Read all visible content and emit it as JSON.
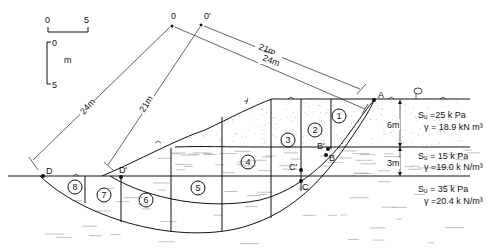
{
  "scale": {
    "horizontal": {
      "start": "0",
      "end": "5"
    },
    "vertical": {
      "start": "0",
      "end": "5",
      "unit": "m"
    }
  },
  "centers": [
    {
      "id": "center-o",
      "label": "0"
    },
    {
      "id": "center-o-prime",
      "label": "0'"
    }
  ],
  "radii": {
    "o_top": "24m",
    "o_prime_top": "21m",
    "o_left": "24m",
    "o_prime_left": "21m"
  },
  "points": {
    "A": "A",
    "B": "B",
    "B_prime": "B'",
    "C": "C",
    "C_prime": "C'",
    "D": "D",
    "D_prime": "D'"
  },
  "slices": [
    "1",
    "2",
    "3",
    "4",
    "5",
    "6",
    "7",
    "8"
  ],
  "layers": [
    {
      "name": "top-layer",
      "thickness": "6m",
      "su": "Sᵤ =25 k Pa",
      "gamma": "γ = 18.9 kN m³"
    },
    {
      "name": "middle-layer",
      "thickness": "3m",
      "su": "Sᵤ = 15 k Pa",
      "gamma": "γ =19.0 k N/m³"
    },
    {
      "name": "bottom-layer",
      "thickness": "",
      "su": "Sᵤ = 35 k Pa",
      "gamma": "γ =20.4 k N/m³"
    }
  ]
}
